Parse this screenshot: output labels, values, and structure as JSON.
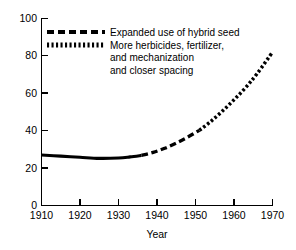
{
  "chart_data": {
    "type": "line",
    "title": "",
    "xlabel": "Year",
    "ylabel": "",
    "xlim": [
      1910,
      1970
    ],
    "ylim": [
      0,
      100
    ],
    "grid": false,
    "legend_position": "upper-left-inside",
    "xticks": [
      "1910",
      "1920",
      "1930",
      "1940",
      "1950",
      "1960",
      "1970"
    ],
    "yticks": [
      "0",
      "20",
      "40",
      "60",
      "80",
      "100"
    ],
    "series": [
      {
        "name": "Open-pollinated / early period",
        "style": "solid",
        "x": [
          1910,
          1915,
          1920,
          1925,
          1930,
          1933,
          1936
        ],
        "values": [
          27,
          26.4,
          25.8,
          25.2,
          25.4,
          26,
          26.8
        ]
      },
      {
        "name": "Expanded use of hybrid seed",
        "style": "dashed",
        "x": [
          1936,
          1939,
          1942,
          1945,
          1948,
          1951
        ],
        "values": [
          26.8,
          28.4,
          30.6,
          33.4,
          36.6,
          40.2
        ]
      },
      {
        "name": "More herbicides, fertilizer, and mechanization and closer spacing",
        "style": "dotted",
        "x": [
          1951,
          1954,
          1957,
          1960,
          1963,
          1966,
          1970
        ],
        "values": [
          40.2,
          45,
          50.5,
          56.5,
          63,
          70.5,
          82
        ]
      }
    ],
    "legend": [
      {
        "swatch": "dashed",
        "lines": [
          "Expanded use of hybrid seed"
        ]
      },
      {
        "swatch": "dotted",
        "lines": [
          "More herbicides, fertilizer,",
          "and mechanization",
          "and closer spacing"
        ]
      }
    ],
    "colors": {
      "line": "#000000",
      "axis": "#000000",
      "background": "#ffffff"
    }
  },
  "axes": {
    "x_tick_0": "1910",
    "x_tick_1": "1920",
    "x_tick_2": "1930",
    "x_tick_3": "1940",
    "x_tick_4": "1950",
    "x_tick_5": "1960",
    "x_tick_6": "1970",
    "y_tick_0": "0",
    "y_tick_1": "20",
    "y_tick_2": "40",
    "y_tick_3": "60",
    "y_tick_4": "80",
    "y_tick_5": "100",
    "x_axis_title": "Year"
  },
  "legend": {
    "entry_1_line_1": "Expanded use of hybrid seed",
    "entry_2_line_1": "More herbicides, fertilizer,",
    "entry_2_line_2": "and mechanization",
    "entry_2_line_3": "and closer spacing"
  }
}
